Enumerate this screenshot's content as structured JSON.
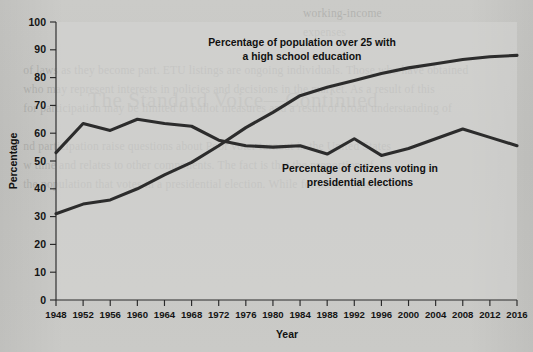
{
  "figure": {
    "background_color": "#c9c9c6",
    "plot_background_color": "#d6d6d3",
    "line_color": "#2c2c2c"
  },
  "scan_artifacts": {
    "bleed_through_title": "The Standard Voice—Continued",
    "bleed_through_lines": "                                                                                              working-income\n                                                                                              expenses\n\n   of laws as they become part. ETU listings are ongoing individuals. Those who have obtained\n   who may represent interests in policies and decisions in the market. As a result of this\n   for participation may be limited to ballot measures and a result of broad understanding of\n\n   nd participation raise questions about Poor voter turnout in the United States\n   w time and relates to other components. The fact is that the proportion of\n   the population that votes in a presidential election. While for most of the world"
  },
  "chart_data": {
    "type": "line",
    "title": "",
    "xlabel": "Year",
    "ylabel": "Percentage",
    "xlim": [
      1948,
      2016
    ],
    "ylim": [
      0,
      100
    ],
    "ytick_step": 10,
    "grid": false,
    "legend_position": "inline-annotation",
    "x": [
      1948,
      1952,
      1956,
      1960,
      1964,
      1968,
      1972,
      1976,
      1980,
      1984,
      1988,
      1992,
      1996,
      2000,
      2004,
      2008,
      2012,
      2016
    ],
    "xticklabels": [
      "1948",
      "1952",
      "1956",
      "1960",
      "1964",
      "1968",
      "1972",
      "1976",
      "1980",
      "1984",
      "1988",
      "1992",
      "1996",
      "2000",
      "2004",
      "2008",
      "2012",
      "2016"
    ],
    "yticklabels": [
      "0",
      "10",
      "20",
      "30",
      "40",
      "50",
      "60",
      "70",
      "80",
      "90",
      "100"
    ],
    "series": [
      {
        "name": "Percentage of citizens voting in presidential elections",
        "values": [
          53,
          63.5,
          61,
          65,
          63.5,
          62.5,
          57.5,
          55.5,
          55,
          55.5,
          52.5,
          58,
          52,
          54.5,
          58,
          61.5,
          58.5,
          55.5
        ],
        "annotation": "Percentage of citizens voting in\npresidential elections"
      },
      {
        "name": "Percentage of population over 25 with a high school education",
        "values": [
          31,
          34.5,
          36,
          40,
          45,
          49.5,
          55.5,
          62,
          67.5,
          73.5,
          76.5,
          79,
          81.5,
          83.5,
          85,
          86.5,
          87.5,
          88
        ],
        "annotation": "Percentage of population over 25 with\na high school education"
      }
    ],
    "annotations": [
      {
        "id": "education-annotation",
        "line1": "Percentage of population over 25 with",
        "line2": "a high school education"
      },
      {
        "id": "turnout-annotation",
        "line1": "Percentage of citizens voting in",
        "line2": "presidential elections"
      }
    ]
  }
}
